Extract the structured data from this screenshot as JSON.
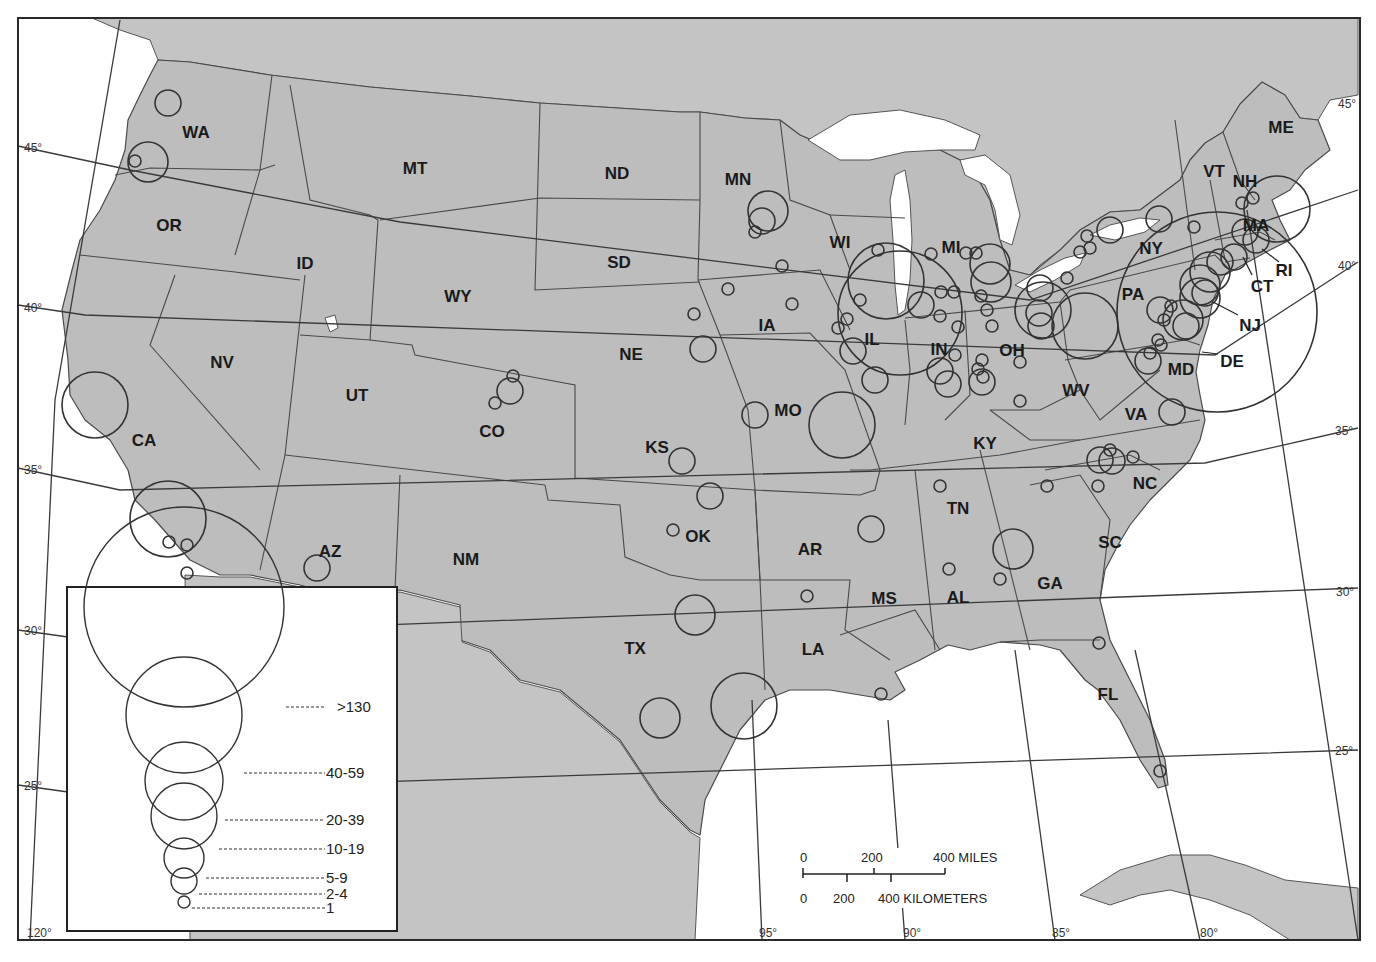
{
  "map": {
    "type": "proportional-symbol",
    "region": "Conterminous United States",
    "background_color": "#ffffff",
    "land_color": "#bdbdbd",
    "water_color": "#ffffff"
  },
  "state_labels": [
    {
      "abbr": "WA",
      "x": 196,
      "y": 132
    },
    {
      "abbr": "OR",
      "x": 169,
      "y": 225
    },
    {
      "abbr": "CA",
      "x": 144,
      "y": 440
    },
    {
      "abbr": "NV",
      "x": 222,
      "y": 362
    },
    {
      "abbr": "ID",
      "x": 305,
      "y": 263
    },
    {
      "abbr": "MT",
      "x": 415,
      "y": 168
    },
    {
      "abbr": "WY",
      "x": 458,
      "y": 296
    },
    {
      "abbr": "UT",
      "x": 357,
      "y": 395
    },
    {
      "abbr": "AZ",
      "x": 330,
      "y": 551
    },
    {
      "abbr": "CO",
      "x": 492,
      "y": 431
    },
    {
      "abbr": "NM",
      "x": 466,
      "y": 559
    },
    {
      "abbr": "ND",
      "x": 617,
      "y": 173
    },
    {
      "abbr": "SD",
      "x": 619,
      "y": 262
    },
    {
      "abbr": "NE",
      "x": 631,
      "y": 354
    },
    {
      "abbr": "KS",
      "x": 657,
      "y": 447
    },
    {
      "abbr": "OK",
      "x": 698,
      "y": 536
    },
    {
      "abbr": "TX",
      "x": 635,
      "y": 648
    },
    {
      "abbr": "MN",
      "x": 738,
      "y": 179
    },
    {
      "abbr": "IA",
      "x": 767,
      "y": 325
    },
    {
      "abbr": "MO",
      "x": 788,
      "y": 410
    },
    {
      "abbr": "AR",
      "x": 810,
      "y": 549
    },
    {
      "abbr": "LA",
      "x": 813,
      "y": 649
    },
    {
      "abbr": "WI",
      "x": 840,
      "y": 242
    },
    {
      "abbr": "IL",
      "x": 872,
      "y": 339
    },
    {
      "abbr": "MI",
      "x": 951,
      "y": 247
    },
    {
      "abbr": "IN",
      "x": 939,
      "y": 349
    },
    {
      "abbr": "OH",
      "x": 1012,
      "y": 350
    },
    {
      "abbr": "KY",
      "x": 985,
      "y": 443
    },
    {
      "abbr": "TN",
      "x": 958,
      "y": 508
    },
    {
      "abbr": "MS",
      "x": 884,
      "y": 598
    },
    {
      "abbr": "AL",
      "x": 958,
      "y": 597
    },
    {
      "abbr": "GA",
      "x": 1050,
      "y": 583
    },
    {
      "abbr": "FL",
      "x": 1108,
      "y": 694
    },
    {
      "abbr": "SC",
      "x": 1110,
      "y": 542
    },
    {
      "abbr": "NC",
      "x": 1145,
      "y": 483
    },
    {
      "abbr": "VA",
      "x": 1136,
      "y": 414
    },
    {
      "abbr": "WV",
      "x": 1076,
      "y": 390
    },
    {
      "abbr": "PA",
      "x": 1133,
      "y": 294
    },
    {
      "abbr": "NY",
      "x": 1151,
      "y": 248
    },
    {
      "abbr": "VT",
      "x": 1214,
      "y": 171
    },
    {
      "abbr": "NH",
      "x": 1245,
      "y": 181
    },
    {
      "abbr": "ME",
      "x": 1281,
      "y": 127
    },
    {
      "abbr": "MA",
      "x": 1256,
      "y": 225
    },
    {
      "abbr": "RI",
      "x": 1284,
      "y": 270
    },
    {
      "abbr": "CT",
      "x": 1262,
      "y": 286
    },
    {
      "abbr": "NJ",
      "x": 1250,
      "y": 325
    },
    {
      "abbr": "DE",
      "x": 1232,
      "y": 361
    },
    {
      "abbr": "MD",
      "x": 1181,
      "y": 369
    }
  ],
  "graticule": {
    "latitudes": [
      {
        "label": "45°",
        "x": 24,
        "y": 152
      },
      {
        "label": "40°",
        "x": 24,
        "y": 312
      },
      {
        "label": "35°",
        "x": 24,
        "y": 474
      },
      {
        "label": "30°",
        "x": 24,
        "y": 635
      },
      {
        "label": "25°",
        "x": 24,
        "y": 790
      },
      {
        "label": "45°",
        "x": 1338,
        "y": 108
      },
      {
        "label": "40°",
        "x": 1338,
        "y": 270
      },
      {
        "label": "35°",
        "x": 1335,
        "y": 435
      },
      {
        "label": "30°",
        "x": 1336,
        "y": 596
      },
      {
        "label": "25°",
        "x": 1335,
        "y": 755
      }
    ],
    "longitudes": [
      {
        "label": "120°",
        "x": 27,
        "y": 937
      },
      {
        "label": "95°",
        "x": 759,
        "y": 937
      },
      {
        "label": "90°",
        "x": 903,
        "y": 937
      },
      {
        "label": "85°",
        "x": 1052,
        "y": 937
      },
      {
        "label": "80°",
        "x": 1200,
        "y": 937
      }
    ]
  },
  "legend": {
    "classes": [
      {
        "label": ">130",
        "r": 100,
        "cy": 707
      },
      {
        "label": "40-59",
        "r": 58,
        "cy": 773
      },
      {
        "label": "20-39",
        "r": 39,
        "cy": 820
      },
      {
        "label": "10-19",
        "r": 33,
        "cy": 849
      },
      {
        "label": "5-9",
        "r": 20,
        "cy": 878
      },
      {
        "label": "2-4",
        "r": 13,
        "cy": 894
      },
      {
        "label": "1",
        "r": 6,
        "cy": 908
      }
    ]
  },
  "scale_bar": {
    "miles_ticks": [
      "0",
      "200",
      "400 MILES"
    ],
    "km_ticks": [
      "0",
      "200",
      "400 KILOMETERS"
    ]
  },
  "symbols": [
    {
      "state": "WA",
      "cx": 168,
      "cy": 103,
      "r": 13
    },
    {
      "state": "OR",
      "cx": 148,
      "cy": 162,
      "r": 20
    },
    {
      "state": "OR",
      "cx": 135,
      "cy": 161,
      "r": 6
    },
    {
      "state": "CA",
      "cx": 95,
      "cy": 405,
      "r": 33
    },
    {
      "state": "CA",
      "cx": 168,
      "cy": 519,
      "r": 38
    },
    {
      "state": "CA",
      "cx": 169,
      "cy": 542,
      "r": 6
    },
    {
      "state": "CA",
      "cx": 187,
      "cy": 545,
      "r": 6
    },
    {
      "state": "CA",
      "cx": 187,
      "cy": 573,
      "r": 6
    },
    {
      "state": "AZ",
      "cx": 317,
      "cy": 568,
      "r": 13
    },
    {
      "state": "CO",
      "cx": 513,
      "cy": 376,
      "r": 6
    },
    {
      "state": "CO",
      "cx": 510,
      "cy": 391,
      "r": 13
    },
    {
      "state": "CO",
      "cx": 495,
      "cy": 403,
      "r": 6
    },
    {
      "state": "NE",
      "cx": 694,
      "cy": 314,
      "r": 6
    },
    {
      "state": "NE",
      "cx": 703,
      "cy": 349,
      "r": 13
    },
    {
      "state": "KS",
      "cx": 682,
      "cy": 461,
      "r": 13
    },
    {
      "state": "OK",
      "cx": 710,
      "cy": 496,
      "r": 13
    },
    {
      "state": "OK",
      "cx": 673,
      "cy": 530,
      "r": 6
    },
    {
      "state": "TX",
      "cx": 695,
      "cy": 615,
      "r": 20
    },
    {
      "state": "TX",
      "cx": 660,
      "cy": 718,
      "r": 20
    },
    {
      "state": "TX",
      "cx": 744,
      "cy": 706,
      "r": 33
    },
    {
      "state": "MN",
      "cx": 768,
      "cy": 211,
      "r": 20
    },
    {
      "state": "MN",
      "cx": 762,
      "cy": 221,
      "r": 13
    },
    {
      "state": "MN",
      "cx": 755,
      "cy": 232,
      "r": 6
    },
    {
      "state": "MN",
      "cx": 782,
      "cy": 266,
      "r": 6
    },
    {
      "state": "IA",
      "cx": 728,
      "cy": 289,
      "r": 6
    },
    {
      "state": "IA",
      "cx": 792,
      "cy": 304,
      "r": 6
    },
    {
      "state": "MO",
      "cx": 755,
      "cy": 415,
      "r": 13
    },
    {
      "state": "MO",
      "cx": 842,
      "cy": 425,
      "r": 33
    },
    {
      "state": "AR",
      "cx": 807,
      "cy": 596,
      "r": 6
    },
    {
      "state": "MS",
      "cx": 871,
      "cy": 529,
      "r": 13
    },
    {
      "state": "LA",
      "cx": 881,
      "cy": 694,
      "r": 6
    },
    {
      "state": "WI",
      "cx": 878,
      "cy": 250,
      "r": 6
    },
    {
      "state": "IL",
      "cx": 886,
      "cy": 281,
      "r": 38
    },
    {
      "state": "IL",
      "cx": 900,
      "cy": 313,
      "r": 62
    },
    {
      "state": "IL",
      "cx": 860,
      "cy": 300,
      "r": 6
    },
    {
      "state": "IL",
      "cx": 847,
      "cy": 319,
      "r": 6
    },
    {
      "state": "IL",
      "cx": 838,
      "cy": 328,
      "r": 6
    },
    {
      "state": "IL",
      "cx": 853,
      "cy": 351,
      "r": 13
    },
    {
      "state": "IL",
      "cx": 875,
      "cy": 380,
      "r": 13
    },
    {
      "state": "IN",
      "cx": 921,
      "cy": 305,
      "r": 13
    },
    {
      "state": "IN",
      "cx": 941,
      "cy": 292,
      "r": 6
    },
    {
      "state": "IN",
      "cx": 954,
      "cy": 292,
      "r": 6
    },
    {
      "state": "IN",
      "cx": 940,
      "cy": 316,
      "r": 6
    },
    {
      "state": "IN",
      "cx": 958,
      "cy": 327,
      "r": 6
    },
    {
      "state": "IN",
      "cx": 955,
      "cy": 355,
      "r": 6
    },
    {
      "state": "IN",
      "cx": 940,
      "cy": 371,
      "r": 13
    },
    {
      "state": "IN",
      "cx": 948,
      "cy": 384,
      "r": 13
    },
    {
      "state": "MI",
      "cx": 931,
      "cy": 254,
      "r": 6
    },
    {
      "state": "MI",
      "cx": 966,
      "cy": 253,
      "r": 6
    },
    {
      "state": "MI",
      "cx": 976,
      "cy": 253,
      "r": 6
    },
    {
      "state": "MI",
      "cx": 990,
      "cy": 264,
      "r": 20
    },
    {
      "state": "MI",
      "cx": 991,
      "cy": 282,
      "r": 20
    },
    {
      "state": "MI",
      "cx": 981,
      "cy": 296,
      "r": 6
    },
    {
      "state": "OH",
      "cx": 987,
      "cy": 310,
      "r": 6
    },
    {
      "state": "OH",
      "cx": 992,
      "cy": 326,
      "r": 6
    },
    {
      "state": "OH",
      "cx": 1040,
      "cy": 288,
      "r": 13
    },
    {
      "state": "OH",
      "cx": 1039,
      "cy": 313,
      "r": 13
    },
    {
      "state": "OH",
      "cx": 1041,
      "cy": 326,
      "r": 13
    },
    {
      "state": "OH",
      "cx": 1043,
      "cy": 310,
      "r": 28
    },
    {
      "state": "OH",
      "cx": 1020,
      "cy": 362,
      "r": 6
    },
    {
      "state": "OH",
      "cx": 982,
      "cy": 360,
      "r": 6
    },
    {
      "state": "OH",
      "cx": 983,
      "cy": 377,
      "r": 6
    },
    {
      "state": "OH",
      "cx": 978,
      "cy": 369,
      "r": 6
    },
    {
      "state": "OH",
      "cx": 982,
      "cy": 382,
      "r": 13
    },
    {
      "state": "OH",
      "cx": 1020,
      "cy": 401,
      "r": 6
    },
    {
      "state": "PA",
      "cx": 1085,
      "cy": 326,
      "r": 33
    },
    {
      "state": "PA",
      "cx": 1067,
      "cy": 278,
      "r": 6
    },
    {
      "state": "PA",
      "cx": 1080,
      "cy": 252,
      "r": 6
    },
    {
      "state": "NY",
      "cx": 1087,
      "cy": 236,
      "r": 6
    },
    {
      "state": "NY",
      "cx": 1090,
      "cy": 248,
      "r": 6
    },
    {
      "state": "NY",
      "cx": 1110,
      "cy": 230,
      "r": 13
    },
    {
      "state": "NY",
      "cx": 1159,
      "cy": 219,
      "r": 13
    },
    {
      "state": "NY",
      "cx": 1194,
      "cy": 227,
      "r": 6
    },
    {
      "state": "NE-REGION",
      "cx": 1217,
      "cy": 312,
      "r": 100
    },
    {
      "state": "NH",
      "cx": 1242,
      "cy": 203,
      "r": 6
    },
    {
      "state": "NH",
      "cx": 1253,
      "cy": 198,
      "r": 6
    },
    {
      "state": "MA",
      "cx": 1277,
      "cy": 209,
      "r": 33
    },
    {
      "state": "MA",
      "cx": 1245,
      "cy": 232,
      "r": 13
    },
    {
      "state": "MA",
      "cx": 1256,
      "cy": 240,
      "r": 13
    },
    {
      "state": "CT",
      "cx": 1234,
      "cy": 257,
      "r": 13
    },
    {
      "state": "CT",
      "cx": 1220,
      "cy": 262,
      "r": 13
    },
    {
      "state": "NY",
      "cx": 1210,
      "cy": 272,
      "r": 20
    },
    {
      "state": "NY",
      "cx": 1200,
      "cy": 285,
      "r": 20
    },
    {
      "state": "NJ",
      "cx": 1205,
      "cy": 293,
      "r": 13
    },
    {
      "state": "NJ",
      "cx": 1200,
      "cy": 298,
      "r": 20
    },
    {
      "state": "PA",
      "cx": 1183,
      "cy": 320,
      "r": 20
    },
    {
      "state": "PA",
      "cx": 1160,
      "cy": 310,
      "r": 13
    },
    {
      "state": "PA",
      "cx": 1171,
      "cy": 306,
      "r": 6
    },
    {
      "state": "PA",
      "cx": 1164,
      "cy": 320,
      "r": 6
    },
    {
      "state": "NJ",
      "cx": 1186,
      "cy": 326,
      "r": 13
    },
    {
      "state": "MD",
      "cx": 1158,
      "cy": 340,
      "r": 6
    },
    {
      "state": "MD",
      "cx": 1161,
      "cy": 345,
      "r": 6
    },
    {
      "state": "MD",
      "cx": 1148,
      "cy": 361,
      "r": 13
    },
    {
      "state": "MD",
      "cx": 1150,
      "cy": 353,
      "r": 6
    },
    {
      "state": "VA",
      "cx": 1172,
      "cy": 412,
      "r": 13
    },
    {
      "state": "NC",
      "cx": 1100,
      "cy": 460,
      "r": 13
    },
    {
      "state": "NC",
      "cx": 1112,
      "cy": 461,
      "r": 13
    },
    {
      "state": "NC",
      "cx": 1110,
      "cy": 450,
      "r": 6
    },
    {
      "state": "NC",
      "cx": 1133,
      "cy": 457,
      "r": 6
    },
    {
      "state": "NC",
      "cx": 1098,
      "cy": 486,
      "r": 6
    },
    {
      "state": "TN",
      "cx": 940,
      "cy": 486,
      "r": 6
    },
    {
      "state": "TN",
      "cx": 1047,
      "cy": 486,
      "r": 6
    },
    {
      "state": "GA",
      "cx": 1013,
      "cy": 549,
      "r": 20
    },
    {
      "state": "GA",
      "cx": 1000,
      "cy": 579,
      "r": 6
    },
    {
      "state": "AL",
      "cx": 949,
      "cy": 569,
      "r": 6
    },
    {
      "state": "FL",
      "cx": 1099,
      "cy": 643,
      "r": 6
    },
    {
      "state": "FL",
      "cx": 1160,
      "cy": 771,
      "r": 6
    }
  ],
  "leaders": [
    {
      "label": "NJ",
      "x1": 1213,
      "y1": 302,
      "x2": 1238,
      "y2": 315
    },
    {
      "label": "DE",
      "x1": 1202,
      "y1": 352,
      "x2": 1218,
      "y2": 354
    },
    {
      "label": "RI",
      "x1": 1262,
      "y1": 249,
      "x2": 1279,
      "y2": 262
    },
    {
      "label": "CT",
      "x1": 1243,
      "y1": 257,
      "x2": 1252,
      "y2": 275
    }
  ]
}
